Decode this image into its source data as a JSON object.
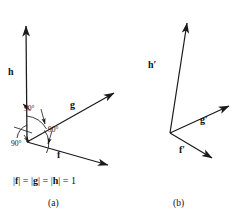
{
  "figure": {
    "width": 237,
    "height": 220,
    "background_color": "#ffffff",
    "stroke_color": "#1a1a1a",
    "text_color": "#111111",
    "norm_caption": "|f| = |g| = |h| = 1"
  },
  "panel_a": {
    "caption": "(a)",
    "origin": {
      "x": 27,
      "y": 142
    },
    "vectors": [
      {
        "name": "h",
        "label": "h",
        "label_x": 8,
        "label_y": 67,
        "tip_x": 26,
        "tip_y": 22,
        "direction_deg": 90
      },
      {
        "name": "g",
        "label": "g",
        "label_x": 70,
        "label_y": 100,
        "tip_x": 117,
        "tip_y": 91,
        "direction_deg": 29
      },
      {
        "name": "f",
        "label": "f",
        "label_x": 57,
        "label_y": 150,
        "tip_x": 111,
        "tip_y": 167,
        "direction_deg": -17
      }
    ],
    "angle_annotations": [
      {
        "name": "angle-h-g",
        "label": "90°",
        "label_x": 24,
        "label_y": 105
      },
      {
        "name": "angle-g-f",
        "label": "90°",
        "label_x": 48,
        "label_y": 126
      },
      {
        "name": "angle-f-h",
        "label": "90°",
        "label_x": 18,
        "label_y": 140
      }
    ]
  },
  "panel_b": {
    "caption": "(b)",
    "origin": {
      "x": 170,
      "y": 133
    },
    "vectors": [
      {
        "name": "h-prime",
        "label": "h′",
        "label_x": 148,
        "label_y": 60,
        "tip_x": 189,
        "tip_y": 18
      },
      {
        "name": "g-prime",
        "label": "g′",
        "label_x": 200,
        "label_y": 115,
        "tip_x": 233,
        "tip_y": 103
      },
      {
        "name": "f-prime",
        "label": "f′",
        "label_x": 179,
        "label_y": 145,
        "tip_x": 216,
        "tip_y": 161
      }
    ]
  },
  "captions": {
    "a_x": 48,
    "a_y": 199,
    "b_x": 173,
    "b_y": 199,
    "norm_x": 13,
    "norm_y": 176
  }
}
